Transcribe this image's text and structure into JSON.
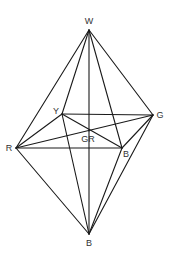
{
  "diagram": {
    "type": "octahedron color-solid",
    "vertices": {
      "W": {
        "label": "W",
        "x": 89,
        "y": 30,
        "lx": 89,
        "ly": 24,
        "anchor": "middle"
      },
      "Y": {
        "label": "Y",
        "x": 62,
        "y": 114,
        "lx": 56,
        "ly": 114,
        "anchor": "middle"
      },
      "G": {
        "label": "G",
        "x": 153,
        "y": 115,
        "lx": 160,
        "ly": 118,
        "anchor": "middle"
      },
      "R": {
        "label": "R",
        "x": 16,
        "y": 148,
        "lx": 9,
        "ly": 151,
        "anchor": "middle"
      },
      "B": {
        "label": "B",
        "x": 122,
        "y": 148,
        "lx": 126,
        "ly": 157,
        "anchor": "middle"
      },
      "GR": {
        "label": "GR",
        "x": 89,
        "y": 131,
        "lx": 88,
        "ly": 142,
        "anchor": "middle"
      },
      "BK": {
        "label": "B",
        "x": 89,
        "y": 234,
        "lx": 89,
        "ly": 246,
        "anchor": "middle"
      }
    },
    "edges": [
      [
        "W",
        "R"
      ],
      [
        "W",
        "Y"
      ],
      [
        "W",
        "GR"
      ],
      [
        "W",
        "B"
      ],
      [
        "W",
        "G"
      ],
      [
        "Y",
        "G"
      ],
      [
        "R",
        "B"
      ],
      [
        "Y",
        "B"
      ],
      [
        "R",
        "G"
      ],
      [
        "R",
        "Y"
      ],
      [
        "G",
        "B"
      ],
      [
        "BK",
        "R"
      ],
      [
        "BK",
        "Y"
      ],
      [
        "BK",
        "GR"
      ],
      [
        "BK",
        "B"
      ],
      [
        "BK",
        "G"
      ]
    ]
  }
}
